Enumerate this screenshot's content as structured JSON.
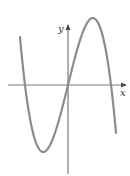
{
  "diagram": {
    "type": "function-graph",
    "axes": {
      "x_label": "x",
      "y_label": "y"
    },
    "colors": {
      "curve": "#8c8c8c",
      "axes": "#4a4a4a",
      "background": "#ffffff"
    },
    "features": {
      "roots": [
        "negative root",
        "origin",
        "positive root"
      ],
      "local_max": "left of y-axis, above x-axis",
      "local_min": "right of y-axis, below x-axis",
      "end_behavior": "falls to the left, rises to the right"
    }
  }
}
